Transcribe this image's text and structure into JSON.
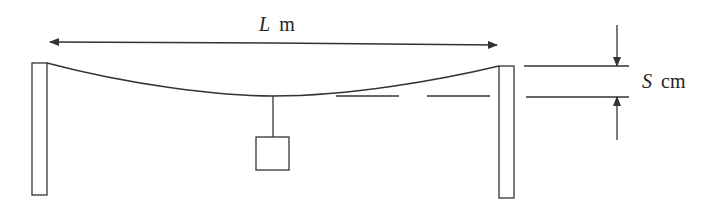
{
  "diagram": {
    "type": "physics-setup",
    "colors": {
      "stroke": "#333333",
      "background": "#ffffff"
    },
    "span_label": {
      "var": "L",
      "unit": "m"
    },
    "sag_label": {
      "var": "S",
      "unit": "cm"
    },
    "elements": [
      "left-post",
      "right-post",
      "sagging-wire",
      "hanging-weight",
      "span-dimension-arrow",
      "sag-dimension-arrows",
      "dashed-reference-line"
    ]
  }
}
